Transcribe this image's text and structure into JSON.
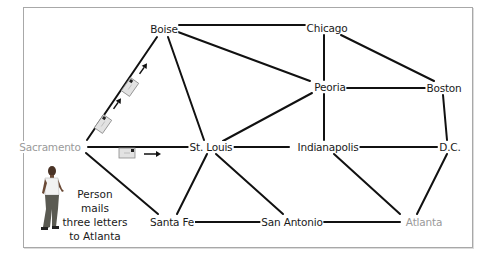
{
  "diagram": {
    "type": "network",
    "nodes": [
      {
        "id": "boise",
        "label": "Boise",
        "x": 164,
        "y": 29,
        "highlight": false
      },
      {
        "id": "chicago",
        "label": "Chicago",
        "x": 327,
        "y": 28,
        "highlight": false
      },
      {
        "id": "peoria",
        "label": "Peoria",
        "x": 330,
        "y": 87,
        "highlight": false
      },
      {
        "id": "boston",
        "label": "Boston",
        "x": 443,
        "y": 88,
        "highlight": false
      },
      {
        "id": "sacramento",
        "label": "Sacramento",
        "x": 50,
        "y": 147,
        "highlight": true
      },
      {
        "id": "stlouis",
        "label": "St. Louis",
        "x": 211,
        "y": 147,
        "highlight": false
      },
      {
        "id": "indianapolis",
        "label": "Indianapolis",
        "x": 328,
        "y": 147,
        "highlight": false
      },
      {
        "id": "dc",
        "label": "D.C.",
        "x": 450,
        "y": 147,
        "highlight": false
      },
      {
        "id": "santafe",
        "label": "Santa Fe",
        "x": 172,
        "y": 222,
        "highlight": false
      },
      {
        "id": "sanantonio",
        "label": "San Antonio",
        "x": 292,
        "y": 222,
        "highlight": false
      },
      {
        "id": "atlanta",
        "label": "Atlanta",
        "x": 424,
        "y": 222,
        "highlight": true
      }
    ],
    "edges": [
      [
        "boise",
        "chicago"
      ],
      [
        "boise",
        "peoria"
      ],
      [
        "boise",
        "stlouis"
      ],
      [
        "boise",
        "sacramento"
      ],
      [
        "chicago",
        "peoria"
      ],
      [
        "chicago",
        "boston"
      ],
      [
        "peoria",
        "boston"
      ],
      [
        "peoria",
        "stlouis"
      ],
      [
        "peoria",
        "indianapolis"
      ],
      [
        "boston",
        "dc"
      ],
      [
        "sacramento",
        "stlouis"
      ],
      [
        "sacramento",
        "santafe"
      ],
      [
        "stlouis",
        "indianapolis"
      ],
      [
        "stlouis",
        "santafe"
      ],
      [
        "stlouis",
        "sanantonio"
      ],
      [
        "indianapolis",
        "dc"
      ],
      [
        "indianapolis",
        "atlanta"
      ],
      [
        "dc",
        "atlanta"
      ],
      [
        "santafe",
        "sanantonio"
      ],
      [
        "sanantonio",
        "atlanta"
      ]
    ],
    "caption": "Person mails three letters to Atlanta",
    "caption_lines": [
      "Person mails",
      "three letters",
      "to Atlanta"
    ],
    "letters_count": 3,
    "colors": {
      "edge": "#111111",
      "highlight_label": "#9a9a9a",
      "envelope_fill": "#e2e2e2",
      "frame_border": "#a8a8a8"
    }
  }
}
